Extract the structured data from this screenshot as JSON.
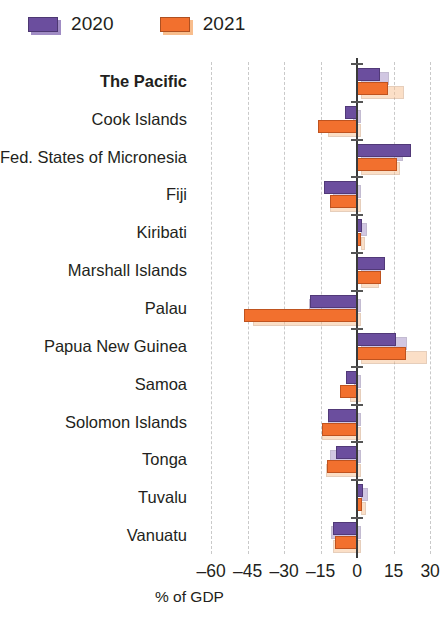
{
  "legend": {
    "items": [
      {
        "label": "2020",
        "color": "#6B4E9E",
        "shadow_color": "#A08CC4"
      },
      {
        "label": "2021",
        "color": "#F2702E",
        "shadow_color": "#F8BD8C"
      }
    ]
  },
  "axis": {
    "x_title": "% of GDP",
    "x_ticks": [
      "–60",
      "–45",
      "–30",
      "–15",
      "0",
      "15",
      "30"
    ],
    "x_tick_values": [
      -60,
      -45,
      -30,
      -15,
      0,
      15,
      30
    ]
  },
  "chart_data": {
    "type": "bar",
    "orientation": "horizontal",
    "title": "",
    "xlabel": "% of GDP",
    "ylabel": "",
    "xlim": [
      -65,
      32
    ],
    "grid": true,
    "legend_position": "top-left",
    "categories": [
      "The Pacific",
      "Cook Islands",
      "Fed. States of Micronesia",
      "Fiji",
      "Kiribati",
      "Marshall Islands",
      "Palau",
      "Papua New Guinea",
      "Samoa",
      "Solomon Islands",
      "Tonga",
      "Tuvalu",
      "Vanuatu"
    ],
    "highlighted_category": "The Pacific",
    "series": [
      {
        "name": "2020",
        "color": "#6B4E9E",
        "values": [
          9.5,
          -5.0,
          22.0,
          -13.5,
          2.0,
          11.5,
          -19.5,
          16.0,
          -4.5,
          -12.0,
          -8.5,
          2.5,
          -10.0
        ]
      },
      {
        "name": "2021",
        "color": "#F2702E",
        "values": [
          12.5,
          -16.0,
          16.5,
          -11.0,
          1.5,
          10.0,
          -46.5,
          20.0,
          -7.0,
          -14.5,
          -12.5,
          2.0,
          -9.0
        ]
      }
    ],
    "shadow_series": [
      {
        "name": "2020-shadow",
        "color": "#A08CC4",
        "values": [
          11.5,
          -3.5,
          17.0,
          -11.5,
          2.5,
          8.0,
          -21.5,
          19.0,
          -3.0,
          -13.5,
          -13.0,
          3.0,
          -12.5
        ]
      },
      {
        "name": "2021-shadow",
        "color": "#F8BD8C",
        "values": [
          17.5,
          -13.5,
          16.0,
          -13.0,
          1.5,
          7.5,
          -44.5,
          27.0,
          -4.5,
          -16.0,
          -14.5,
          2.0,
          -11.5
        ]
      }
    ]
  }
}
